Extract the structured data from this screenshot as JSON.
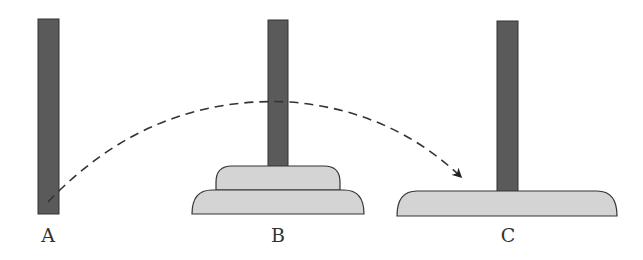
{
  "diagram": {
    "pegs": [
      {
        "id": "A",
        "label": "A",
        "disks": 0
      },
      {
        "id": "B",
        "label": "B",
        "disks": 2
      },
      {
        "id": "C",
        "label": "C",
        "disks": 1
      }
    ],
    "arrow": {
      "from": "A",
      "to": "C",
      "style": "dashed"
    },
    "colors": {
      "peg": "#5a5a5a",
      "disk": "#d4d4d4",
      "outline": "#333333",
      "arrow": "#333333"
    }
  }
}
